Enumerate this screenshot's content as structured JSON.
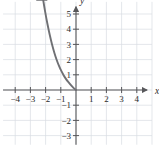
{
  "figure": {
    "kind": "cartesian-graph",
    "width": 159,
    "height": 152,
    "background_color": "#ffffff",
    "grid_color": "#d9dce2",
    "axis_color": "#58585b",
    "curve_color": "#6f7074",
    "label_color": "#2b2b2b"
  },
  "chart_data": {
    "type": "line",
    "title": "",
    "xlabel": "x",
    "ylabel": "y",
    "xlim": [
      -4.8,
      5.0
    ],
    "ylim": [
      -3.6,
      5.8
    ],
    "grid": true,
    "legend": null,
    "axis_arrows": {
      "x_positive": true,
      "y_positive": true,
      "x_negative": false,
      "y_negative": false
    },
    "xticks": [
      -4,
      -3,
      -2,
      -1,
      1,
      2,
      3,
      4
    ],
    "xticklabels": [
      "−4",
      "−3",
      "−2",
      "−1",
      "1",
      "2",
      "3",
      "4"
    ],
    "yticks": [
      5,
      4,
      3,
      2,
      1,
      -1,
      -2,
      -3
    ],
    "yticklabels": [
      "5",
      "4",
      "3",
      "2",
      "1",
      "−1",
      "−2",
      "−3"
    ],
    "series": [
      {
        "name": "exponential-decay-curve",
        "color": "#6f7074",
        "arrow_end": "start",
        "description": "Curve falls steeply from upper left, flattens and approaches the x-axis (y = 0) near the origin",
        "points": [
          [
            -2.25,
            6.5
          ],
          [
            -2.1,
            5.55
          ],
          [
            -1.95,
            4.7
          ],
          [
            -1.8,
            3.95
          ],
          [
            -1.65,
            3.28
          ],
          [
            -1.5,
            2.7
          ],
          [
            -1.35,
            2.2
          ],
          [
            -1.2,
            1.78
          ],
          [
            -1.05,
            1.42
          ],
          [
            -0.9,
            1.12
          ],
          [
            -0.75,
            0.86
          ],
          [
            -0.6,
            0.64
          ],
          [
            -0.45,
            0.46
          ],
          [
            -0.3,
            0.28
          ],
          [
            -0.18,
            0.15
          ],
          [
            -0.08,
            0.06
          ],
          [
            0.0,
            0.0
          ]
        ]
      }
    ]
  },
  "labels": {
    "x_axis_name": "x",
    "y_axis_name": "y"
  }
}
